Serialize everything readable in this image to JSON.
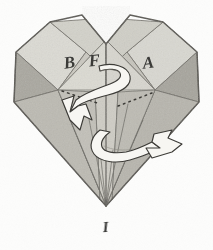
{
  "figure": {
    "kind": "origami-folded-heart-diagram",
    "title": "Folded paper heart with rotation arrows",
    "background_color": "#fdfdfc",
    "ink_color": "#4a4a46",
    "ink_color_dark": "#34332f",
    "arrow_fill": "#f6f5f1",
    "arrow_stroke": "#3d3c38",
    "palette": {
      "paper_lightest": "#e3e2dc",
      "paper_light": "#d6d5ce",
      "paper_mid": "#c8c7bf",
      "paper_mid_dark": "#bbb9b1",
      "paper_dark": "#aeaca4",
      "paper_darkest": "#9f9d95",
      "paper_shadow": "#928f87"
    }
  },
  "labels": {
    "b": "B",
    "f": "F",
    "a": "A",
    "i": "I"
  },
  "annotations": {
    "dotted_line_left": "dotted guide line to left rotation arrow",
    "dotted_line_right": "dotted guide line to right rotation arrow",
    "arrow_left": "white ribbon arrow pointing down-left",
    "arrow_right": "white ribbon arrow pointing right",
    "ribbon": "twisted ribbon indicating rotation about vertical center fold"
  }
}
